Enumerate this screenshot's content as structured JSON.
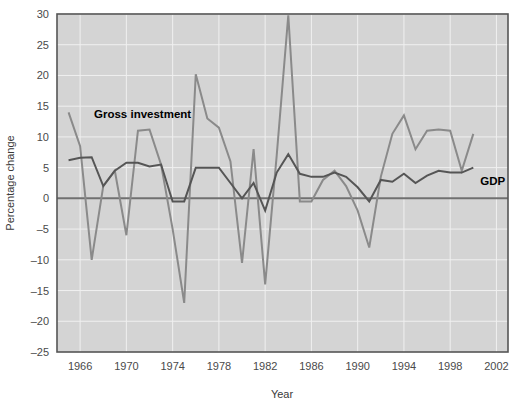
{
  "chart_data": {
    "type": "line",
    "title": "",
    "xlabel": "Year",
    "ylabel": "Percentage change",
    "xlim": [
      1964,
      2003
    ],
    "ylim": [
      -25,
      30
    ],
    "xticks": [
      1966,
      1970,
      1974,
      1978,
      1982,
      1986,
      1990,
      1994,
      1998,
      2002
    ],
    "yticks": [
      -25,
      -20,
      -15,
      -10,
      -5,
      0,
      5,
      10,
      15,
      20,
      25,
      30
    ],
    "grid": true,
    "legend_position": "inline-annotation",
    "zero_line": 0,
    "x": [
      1965,
      1966,
      1967,
      1968,
      1969,
      1970,
      1971,
      1972,
      1973,
      1974,
      1975,
      1976,
      1977,
      1978,
      1979,
      1980,
      1981,
      1982,
      1983,
      1984,
      1985,
      1986,
      1987,
      1988,
      1989,
      1990,
      1991,
      1992,
      1993,
      1994,
      1995,
      1996,
      1997,
      1998,
      1999,
      2000
    ],
    "series": [
      {
        "name": "Gross investment",
        "color": "#8a8a8a",
        "label_text": "Gross investment",
        "label_x": 1967.2,
        "label_y": 13.0,
        "values": [
          14.0,
          8.5,
          -10.0,
          2.0,
          4.5,
          -6.0,
          11.0,
          11.2,
          5.5,
          -5.0,
          -17.0,
          20.2,
          13.0,
          11.5,
          6.0,
          -10.5,
          8.0,
          -14.0,
          7.0,
          29.8,
          -0.5,
          -0.5,
          3.0,
          4.5,
          2.0,
          -2.0,
          -8.0,
          3.5,
          10.5,
          13.5,
          8.0,
          11.0,
          11.2,
          11.0,
          4.5,
          10.5
        ]
      },
      {
        "name": "GDP",
        "color": "#555555",
        "label_text": "GDP",
        "label_x": 2000.6,
        "label_y": 2.2,
        "values": [
          6.2,
          6.6,
          6.7,
          2.0,
          4.5,
          5.8,
          5.8,
          5.2,
          5.5,
          -0.5,
          -0.5,
          5.0,
          5.0,
          5.0,
          2.5,
          0.0,
          2.5,
          -2.0,
          4.2,
          7.2,
          4.0,
          3.5,
          3.5,
          4.2,
          3.5,
          1.8,
          -0.5,
          3.0,
          2.7,
          4.0,
          2.5,
          3.7,
          4.5,
          4.2,
          4.2,
          5.0
        ]
      }
    ]
  },
  "figure": {
    "plot_bg_color": "#d4d4d4",
    "grid_color": "#f0f0f0",
    "border_color": "#555555",
    "zero_line_color": "#707070",
    "background": "#ffffff"
  }
}
